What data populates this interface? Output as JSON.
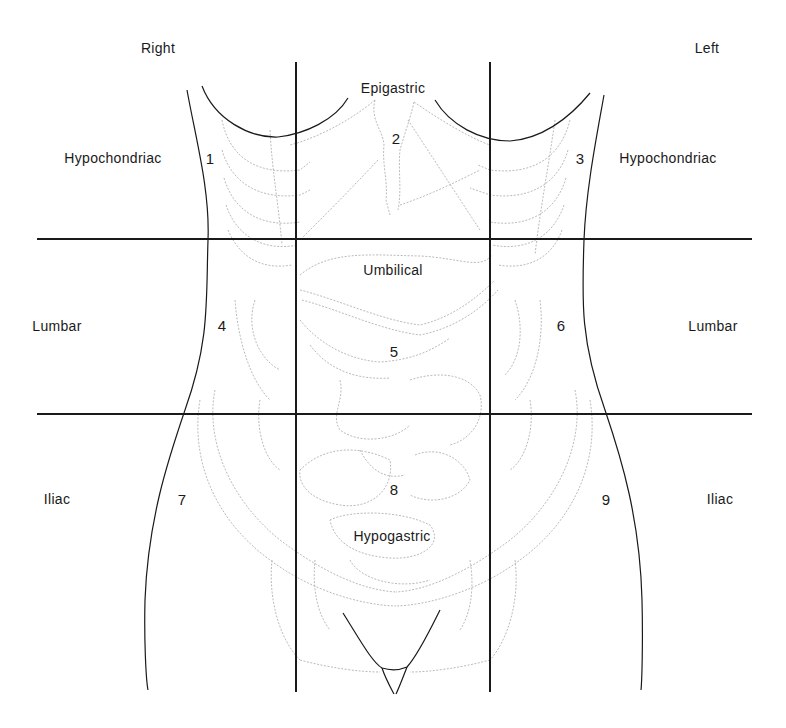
{
  "figure": {
    "orientation": {
      "right_label": "Right",
      "left_label": "Left"
    },
    "regions": [
      {
        "number": "1",
        "name": "Hypochondriac",
        "side": "right",
        "row": "upper"
      },
      {
        "number": "2",
        "name": "Epigastric",
        "side": "center",
        "row": "upper"
      },
      {
        "number": "3",
        "name": "Hypochondriac",
        "side": "left",
        "row": "upper"
      },
      {
        "number": "4",
        "name": "Lumbar",
        "side": "right",
        "row": "middle"
      },
      {
        "number": "5",
        "name": "Umbilical",
        "side": "center",
        "row": "middle"
      },
      {
        "number": "6",
        "name": "Lumbar",
        "side": "left",
        "row": "middle"
      },
      {
        "number": "7",
        "name": "Iliac",
        "side": "right",
        "row": "lower"
      },
      {
        "number": "8",
        "name": "Hypogastric",
        "side": "center",
        "row": "lower"
      },
      {
        "number": "9",
        "name": "Iliac",
        "side": "left",
        "row": "lower"
      }
    ],
    "grid_lines": {
      "vertical_x": [
        296,
        490
      ],
      "horizontal_y": [
        239,
        414
      ]
    },
    "colors": {
      "outline": "#1a1a1a",
      "organs": "#9a9a9a",
      "background": "#ffffff"
    }
  }
}
